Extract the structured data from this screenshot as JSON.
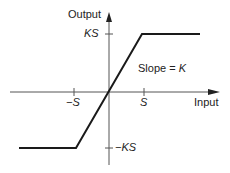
{
  "diagram": {
    "y_axis_label": "Output",
    "x_axis_label": "Input",
    "y_tick_pos": "KS",
    "y_tick_neg": "−KS",
    "x_tick_pos": "S",
    "x_tick_neg": "−S",
    "slope_label": "Slope = ",
    "slope_symbol": "K",
    "line_color": "#1a1a1a"
  }
}
